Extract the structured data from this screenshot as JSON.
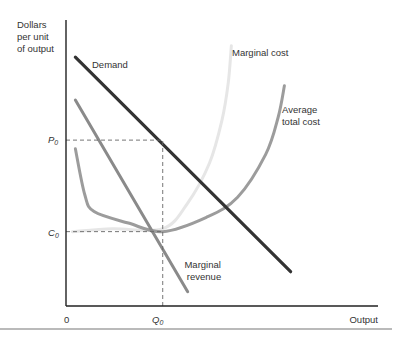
{
  "chart_data": {
    "type": "line",
    "title": "",
    "ylabel": [
      "Dollars",
      "per unit",
      "of output"
    ],
    "xlabel": "Output",
    "origin_label": "0",
    "grid": false,
    "legend": "none (curves labeled inline)",
    "x_ticks": [
      {
        "label": "Q",
        "subscript": "0",
        "value": 0.31
      }
    ],
    "y_ticks": [
      {
        "label": "P",
        "subscript": "0",
        "value": 0.58
      },
      {
        "label": "C",
        "subscript": "0",
        "value": 0.26
      }
    ],
    "xlim": [
      0,
      1
    ],
    "ylim": [
      0,
      1
    ],
    "series": [
      {
        "name": "Demand",
        "label": "Demand",
        "color": "#333333",
        "points": [
          [
            0.03,
            0.87
          ],
          [
            0.72,
            0.12
          ]
        ]
      },
      {
        "name": "Marginal revenue",
        "label": [
          "Marginal",
          "revenue"
        ],
        "color": "#8a8a8a",
        "points": [
          [
            0.03,
            0.72
          ],
          [
            0.39,
            0.05
          ]
        ]
      },
      {
        "name": "Average total cost",
        "label": [
          "Average",
          "total cost"
        ],
        "color": "#9c9c9c",
        "points": [
          [
            0.03,
            0.55
          ],
          [
            0.06,
            0.39
          ],
          [
            0.09,
            0.33
          ],
          [
            0.2,
            0.29
          ],
          [
            0.31,
            0.26
          ],
          [
            0.45,
            0.31
          ],
          [
            0.55,
            0.38
          ],
          [
            0.64,
            0.53
          ],
          [
            0.68,
            0.66
          ],
          [
            0.7,
            0.77
          ]
        ]
      },
      {
        "name": "Marginal cost",
        "label": "Marginal cost",
        "color": "#e6e6e6",
        "points": [
          [
            0.02,
            0.26
          ],
          [
            0.15,
            0.27
          ],
          [
            0.31,
            0.27
          ],
          [
            0.39,
            0.36
          ],
          [
            0.46,
            0.5
          ],
          [
            0.5,
            0.65
          ],
          [
            0.52,
            0.78
          ],
          [
            0.53,
            0.91
          ]
        ]
      }
    ],
    "guides": [
      {
        "name": "P0-guide",
        "from": "P0 on y-axis",
        "to": "Demand at Q0",
        "style": "dashed"
      },
      {
        "name": "C0-guide",
        "from": "C0 on y-axis",
        "to": "Average total cost at Q0",
        "style": "dashed"
      },
      {
        "name": "Q0-guide",
        "from": "Q0 on x-axis",
        "to": "Demand at Q0",
        "style": "dashed"
      }
    ]
  }
}
